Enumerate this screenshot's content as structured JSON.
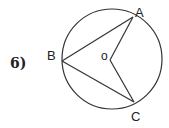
{
  "problem": {
    "number": "6)"
  },
  "diagram": {
    "labels": {
      "A": "A",
      "B": "B",
      "C": "C",
      "O": "o"
    },
    "segments": [
      "BA",
      "BC",
      "OA",
      "OC"
    ],
    "line_color": "#333333"
  }
}
